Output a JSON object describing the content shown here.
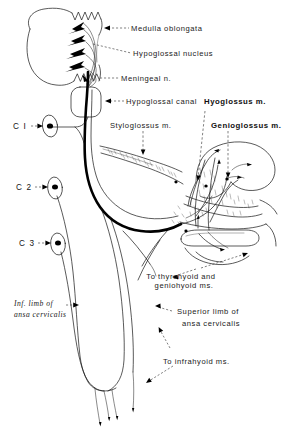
{
  "figure": {
    "type": "anatomical line drawing",
    "background_color": "#ffffff",
    "ink_color": "#141414"
  },
  "labels": {
    "medulla_oblongata": "Medulla  oblongata",
    "hypoglossal_nucleus": "Hypoglossal  nucleus",
    "meningeal_n": "Meningeal  n.",
    "hypoglossal_canal": "Hypoglossal  canal",
    "hyoglossus_m": "Hyoglossus  m.",
    "styloglossus_m": "Styloglossus  m.",
    "genioglossus_m": "Genioglossus  m.",
    "to_thyrohyoid_line1": "To  thyrohyoid  and",
    "to_thyrohyoid_line2": "geniohyoid   ms.",
    "inf_limb_line1": "Inf.  limb  of",
    "inf_limb_line2": "ansa  cervicalis",
    "superior_limb_line1": "Superior  limb  of",
    "superior_limb_line2": "ansa  cervicalis",
    "to_infrahyoid": "To  infrahyoid  ms.",
    "c1": "C  I",
    "c2": "C 2",
    "c3": "C 3"
  },
  "structures": {
    "medulla": "oval with serrated posterior border",
    "nerve_trunk": "thick black hypoglossal nerve",
    "ansa_loop": "elongated ansa cervicalis loop",
    "ganglia": [
      "C1 spinal ganglion",
      "C2 spinal ganglion",
      "C3 spinal ganglion"
    ],
    "hyoid_bone": "elongated outline lower centre-right",
    "tongue": "tongue and floor-of-mouth musculature, stippled"
  }
}
